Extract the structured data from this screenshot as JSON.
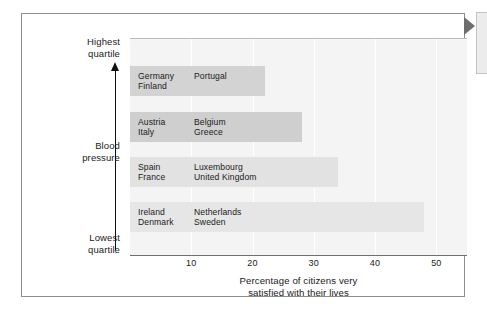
{
  "chart_data": {
    "type": "bar",
    "orientation": "horizontal",
    "title": "",
    "xlabel": "Percentage of citizens very satisfied with their lives",
    "xlabel_lines": [
      "Percentage of citizens very",
      "satisfied with their lives"
    ],
    "ylabel": "Blood pressure",
    "y_axis_top_label": "Highest quartile",
    "y_axis_top_label_lines": [
      "Highest",
      "quartile"
    ],
    "y_axis_bottom_label": "Lowest quartile",
    "y_axis_bottom_label_lines": [
      "Lowest",
      "quartile"
    ],
    "xlim": [
      0,
      55
    ],
    "xticks": [
      10,
      20,
      30,
      40,
      50
    ],
    "xtick_labels": [
      "10",
      "20",
      "30",
      "40",
      "50"
    ],
    "grid": "vertical",
    "legend": "none",
    "categories": [
      "Highest blood pressure quartile",
      "Second blood pressure quartile",
      "Third blood pressure quartile",
      "Lowest blood pressure quartile"
    ],
    "values": [
      22,
      28,
      34,
      48
    ],
    "bars": [
      {
        "index": 0,
        "value": 22,
        "color": "#d3d3d3",
        "countries_col_a": [
          "Germany",
          "Finland"
        ],
        "countries_col_b": [
          "Portugal"
        ],
        "col_a_text": "Germany\nFinland",
        "col_b_text": "Portugal"
      },
      {
        "index": 1,
        "value": 28,
        "color": "#cfcfcf",
        "countries_col_a": [
          "Austria",
          "Italy"
        ],
        "countries_col_b": [
          "Belgium",
          "Greece"
        ],
        "col_a_text": "Austria\nItaly",
        "col_b_text": "Belgium\nGreece"
      },
      {
        "index": 2,
        "value": 34,
        "color": "#e2e2e2",
        "countries_col_a": [
          "Spain",
          "France"
        ],
        "countries_col_b": [
          "Luxembourg",
          "United Kingdom"
        ],
        "col_a_text": "Spain\nFrance",
        "col_b_text": "Luxembourg\nUnited Kingdom"
      },
      {
        "index": 3,
        "value": 48,
        "color": "#e6e6e6",
        "countries_col_a": [
          "Ireland",
          "Denmark"
        ],
        "countries_col_b": [
          "Netherlands",
          "Sweden"
        ],
        "col_a_text": "Ireland\nDenmark",
        "col_b_text": "Netherlands\nSweden"
      }
    ],
    "colors": {
      "plot_background": "#f4f4f4",
      "gridline": "#ffffff",
      "axis": "#6f6f6f",
      "frame": "#8d8d8d",
      "text": "#1a1a1a",
      "pointer": "#6e6e6e"
    }
  },
  "callout": {
    "text": ""
  }
}
